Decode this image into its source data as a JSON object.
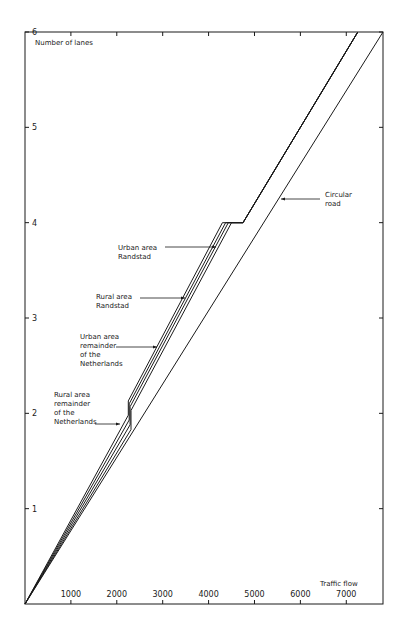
{
  "chart_data": {
    "type": "line",
    "title": "",
    "xlabel": "Traffic flow",
    "ylabel": "Number of lanes",
    "xlim": [
      0,
      7800
    ],
    "ylim": [
      0,
      6
    ],
    "x_ticks": [
      1000,
      2000,
      3000,
      4000,
      5000,
      6000,
      7000
    ],
    "x_tick_labels": [
      "1000",
      "2000",
      "3000",
      "4000",
      "5000",
      "6000",
      "7000"
    ],
    "y_ticks": [
      1,
      2,
      3,
      4,
      5,
      6
    ],
    "y_tick_labels": [
      "1",
      "2",
      "3",
      "4",
      "5",
      "6"
    ],
    "grid": false,
    "series": [
      {
        "name": "Urban area Randstad",
        "x": [
          0,
          2250,
          2250,
          4300,
          4750,
          7250
        ],
        "y": [
          0,
          1.98,
          2.13,
          4.0,
          4.0,
          6.0
        ]
      },
      {
        "name": "Rural area Randstad",
        "x": [
          0,
          2270,
          2270,
          4370,
          4750,
          7250
        ],
        "y": [
          0,
          1.93,
          2.1,
          4.0,
          4.0,
          6.0
        ]
      },
      {
        "name": "Urban area remainder of the Netherlands",
        "x": [
          0,
          2290,
          2290,
          4430,
          4750,
          7250
        ],
        "y": [
          0,
          1.88,
          2.07,
          4.0,
          4.0,
          6.0
        ]
      },
      {
        "name": "Rural area remainder of the Netherlands",
        "x": [
          0,
          2310,
          2310,
          4500,
          4750,
          7250
        ],
        "y": [
          0,
          1.83,
          2.03,
          4.0,
          4.0,
          6.0
        ]
      },
      {
        "name": "Circular road",
        "x": [
          0,
          7800
        ],
        "y": [
          0,
          6.0
        ]
      }
    ],
    "annotations": [
      {
        "text": "Urban area\nRandstad",
        "points_to": "Urban area Randstad"
      },
      {
        "text": "Rural area\nRandstad",
        "points_to": "Rural area Randstad"
      },
      {
        "text": "Urban area\nremainder\nof the\nNetherlands",
        "points_to": "Urban area remainder of the Netherlands"
      },
      {
        "text": "Rural area\nremainder\nof the\nNetherlands",
        "points_to": "Rural area remainder of the Netherlands"
      },
      {
        "text": "Circular\nroad",
        "points_to": "Circular road"
      }
    ]
  },
  "labels": {
    "y_axis_title": "Number of lanes",
    "x_axis_title": "Traffic flow",
    "urban_randstad": [
      "Urban area",
      "Randstad"
    ],
    "rural_randstad": [
      "Rural area",
      "Randstad"
    ],
    "urban_remainder": [
      "Urban area",
      "remainder",
      "of the",
      "Netherlands"
    ],
    "rural_remainder": [
      "Rural area",
      "remainder",
      "of the",
      "Netherlands"
    ],
    "circular_road": [
      "Circular",
      "road"
    ]
  }
}
